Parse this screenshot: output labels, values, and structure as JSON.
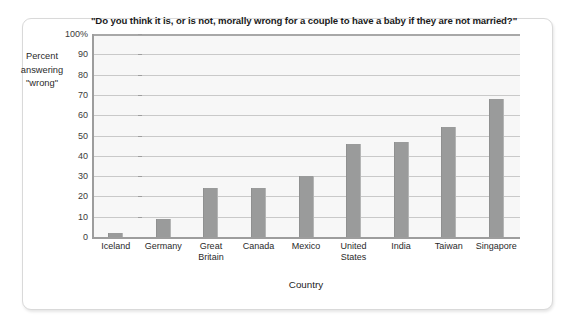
{
  "figure": {
    "title": "\"Do you think it is, or is not, morally wrong for a couple to have a baby if they are not married?\"",
    "y_axis_title_line1": "Percent",
    "y_axis_title_line2": "answering",
    "y_axis_title_line3": "\"wrong\"",
    "x_axis_title": "Country"
  },
  "colors": {
    "bar_fill": "#9a9b9b",
    "plot_background": "#f7f7f7",
    "gridline": "#c9c9c9",
    "axis": "#9d9d9d",
    "frame_border": "#d9d9d9",
    "text": "#1b1b1b"
  },
  "chart_data": {
    "type": "bar",
    "title": "\"Do you think it is, or is not, morally wrong for a couple to have a baby if they are not married?\"",
    "xlabel": "Country",
    "ylabel": "Percent answering \"wrong\"",
    "categories": [
      "Iceland",
      "Germany",
      "Great Britain",
      "Canada",
      "Mexico",
      "United States",
      "India",
      "Taiwan",
      "Singapore"
    ],
    "values": [
      2,
      9,
      24,
      24,
      30,
      46,
      47,
      54,
      68
    ],
    "ylim": [
      0,
      100
    ],
    "ytick_labels": [
      "0",
      "10",
      "20",
      "30",
      "40",
      "50",
      "60",
      "70",
      "80",
      "90",
      "100%"
    ],
    "ytick_values": [
      0,
      10,
      20,
      30,
      40,
      50,
      60,
      70,
      80,
      90,
      100
    ],
    "grid": true,
    "legend": false,
    "legend_position": "none"
  }
}
